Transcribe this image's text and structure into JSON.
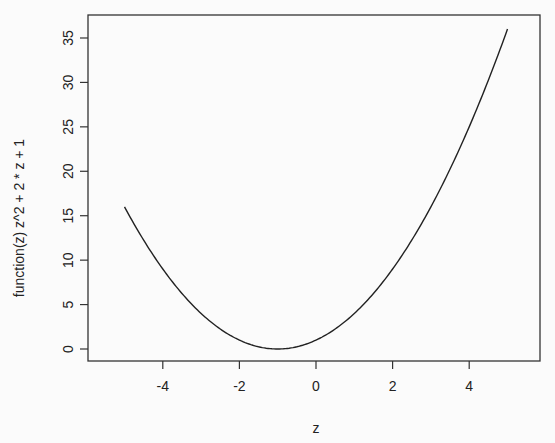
{
  "chart_data": {
    "type": "line",
    "title": "",
    "xlabel": "z",
    "ylabel": "function(z) z^2 + 2 * z + 1",
    "function": "z^2 + 2*z + 1",
    "xlim": [
      -5,
      5
    ],
    "ylim": [
      0,
      36
    ],
    "x_ticks": [
      -4,
      -2,
      0,
      2,
      4
    ],
    "y_ticks": [
      0,
      5,
      10,
      15,
      20,
      25,
      30,
      35
    ],
    "grid": false,
    "legend": null,
    "series": [
      {
        "name": "function(z) z^2 + 2 * z + 1",
        "x": [
          -5,
          -4,
          -3,
          -2,
          -1,
          0,
          1,
          2,
          3,
          4,
          5
        ],
        "values": [
          16,
          9,
          4,
          1,
          0,
          1,
          4,
          9,
          16,
          25,
          36
        ]
      }
    ]
  },
  "layout": {
    "plot_box": {
      "left": 88,
      "top": 15,
      "right": 540,
      "bottom": 361
    },
    "x_map": {
      "z0": 316,
      "px_per_unit": 38.3
    },
    "y_map": {
      "v0": 349,
      "px_per_unit": 8.886
    }
  }
}
